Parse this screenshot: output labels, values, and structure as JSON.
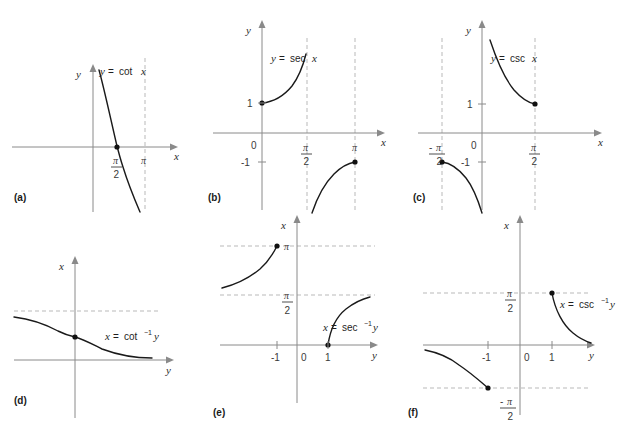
{
  "figure": {
    "background": "#ffffff",
    "curve_color": "#1a1a1a",
    "axis_color": "#8a8a8a",
    "dash_color": "#b9b9b9",
    "width": 621,
    "height": 429
  },
  "panels": [
    {
      "id": "a",
      "letter": "(a)",
      "equation": {
        "lhs": "y",
        "eq": "=",
        "fn": "cot",
        "sup": "",
        "arg": "x",
        "full": "y = cot x"
      },
      "axes": {
        "vertical": "y",
        "horizontal": "x"
      },
      "ticks": [
        {
          "label": "π/2",
          "num": "π",
          "den": "2",
          "axis": "x",
          "value": 1.5708
        },
        {
          "label": "π",
          "num": "π",
          "den": "",
          "axis": "x",
          "value": 3.1416
        }
      ],
      "dashed_lines": [
        {
          "orientation": "vertical",
          "at": "π"
        }
      ],
      "points": [
        {
          "label": "π/2",
          "x": 1.5708,
          "y": 0,
          "filled": true
        }
      ],
      "domain": "0 < x < π"
    },
    {
      "id": "b",
      "letter": "(b)",
      "equation": {
        "lhs": "y",
        "eq": "=",
        "fn": "sec",
        "sup": "",
        "arg": "x",
        "full": "y = sec x"
      },
      "axes": {
        "vertical": "y",
        "horizontal": "x"
      },
      "ticks": [
        {
          "label": "0",
          "axis": "origin"
        },
        {
          "label": "1",
          "axis": "y",
          "value": 1
        },
        {
          "label": "-1",
          "axis": "y",
          "value": -1
        },
        {
          "label": "π/2",
          "num": "π",
          "den": "2",
          "axis": "x",
          "value": 1.5708
        },
        {
          "label": "π",
          "num": "π",
          "den": "",
          "axis": "x",
          "value": 3.1416
        }
      ],
      "dashed_lines": [
        {
          "orientation": "vertical",
          "at": "π/2"
        },
        {
          "orientation": "vertical",
          "at": "π"
        }
      ],
      "points": [
        {
          "label": "(0, 1)",
          "x": 0,
          "y": 1,
          "filled": true
        },
        {
          "label": "(π, -1)",
          "x": 3.1416,
          "y": -1,
          "filled": true
        }
      ],
      "domain": "0 ≤ x < π/2, π/2 < x ≤ π"
    },
    {
      "id": "c",
      "letter": "(c)",
      "equation": {
        "lhs": "y",
        "eq": "=",
        "fn": "csc",
        "sup": "",
        "arg": "x",
        "full": "y = csc x"
      },
      "axes": {
        "vertical": "y",
        "horizontal": "x"
      },
      "ticks": [
        {
          "label": "0",
          "axis": "origin"
        },
        {
          "label": "1",
          "axis": "y",
          "value": 1
        },
        {
          "label": "-1",
          "axis": "y",
          "value": -1
        },
        {
          "label": "-π/2",
          "num": "π",
          "den": "2",
          "sign": "-",
          "axis": "x",
          "value": -1.5708
        },
        {
          "label": "π/2",
          "num": "π",
          "den": "2",
          "axis": "x",
          "value": 1.5708
        }
      ],
      "dashed_lines": [
        {
          "orientation": "vertical",
          "at": "-π/2"
        },
        {
          "orientation": "vertical",
          "at": "π/2"
        }
      ],
      "points": [
        {
          "label": "(π/2, 1)",
          "x": 1.5708,
          "y": 1,
          "filled": true
        },
        {
          "label": "(-π/2, -1)",
          "x": -1.5708,
          "y": -1,
          "filled": true
        }
      ],
      "domain": "-π/2 ≤ x < 0, 0 < x ≤ π/2"
    },
    {
      "id": "d",
      "letter": "(d)",
      "equation": {
        "lhs": "x",
        "eq": "=",
        "fn": "cot",
        "sup": "−1",
        "arg": "y",
        "full": "x = cot⁻¹ y"
      },
      "axes": {
        "vertical": "x",
        "horizontal": "y"
      },
      "ticks": [],
      "dashed_lines": [
        {
          "orientation": "horizontal",
          "at": "π"
        }
      ],
      "points": [
        {
          "label": "(0, π/2)",
          "x": 0,
          "y": 1.5708,
          "filled": true
        }
      ],
      "range": "0 < x < π"
    },
    {
      "id": "e",
      "letter": "(e)",
      "equation": {
        "lhs": "x",
        "eq": "=",
        "fn": "sec",
        "sup": "−1",
        "arg": "y",
        "full": "x = sec⁻¹ y"
      },
      "axes": {
        "vertical": "x",
        "horizontal": "y"
      },
      "ticks": [
        {
          "label": "0",
          "axis": "origin"
        },
        {
          "label": "-1",
          "axis": "y",
          "value": -1
        },
        {
          "label": "1",
          "axis": "y",
          "value": 1
        },
        {
          "label": "π",
          "num": "π",
          "den": "",
          "axis": "x",
          "value": 3.1416
        },
        {
          "label": "π/2",
          "num": "π",
          "den": "2",
          "axis": "x",
          "value": 1.5708
        }
      ],
      "dashed_lines": [
        {
          "orientation": "horizontal",
          "at": "π"
        },
        {
          "orientation": "horizontal",
          "at": "π/2"
        }
      ],
      "points": [
        {
          "label": "(-1, π)",
          "x": -1,
          "y": 3.1416,
          "filled": true
        },
        {
          "label": "(1, 0)",
          "x": 1,
          "y": 0,
          "filled": true
        }
      ],
      "range": "0 ≤ x ≤ π, x ≠ π/2"
    },
    {
      "id": "f",
      "letter": "(f)",
      "equation": {
        "lhs": "x",
        "eq": "=",
        "fn": "csc",
        "sup": "−1",
        "arg": "y",
        "full": "x = csc⁻¹ y"
      },
      "axes": {
        "vertical": "x",
        "horizontal": "y"
      },
      "ticks": [
        {
          "label": "0",
          "axis": "origin"
        },
        {
          "label": "-1",
          "axis": "y",
          "value": -1
        },
        {
          "label": "1",
          "axis": "y",
          "value": 1
        },
        {
          "label": "π/2",
          "num": "π",
          "den": "2",
          "axis": "x",
          "value": 1.5708
        },
        {
          "label": "-π/2",
          "num": "π",
          "den": "2",
          "sign": "-",
          "axis": "x",
          "value": -1.5708
        }
      ],
      "dashed_lines": [
        {
          "orientation": "horizontal",
          "at": "π/2"
        },
        {
          "orientation": "horizontal",
          "at": "-π/2"
        }
      ],
      "points": [
        {
          "label": "(1, π/2)",
          "x": 1,
          "y": 1.5708,
          "filled": true
        },
        {
          "label": "(-1, -π/2)",
          "x": -1,
          "y": -1.5708,
          "filled": true
        }
      ],
      "range": "-π/2 ≤ x ≤ π/2, x ≠ 0"
    }
  ],
  "glyphs": {
    "pi": "π",
    "minus": "−",
    "equals": "=",
    "sup_minus_one": "−1",
    "zero": "0",
    "one": "1",
    "minus_one": "−1"
  }
}
